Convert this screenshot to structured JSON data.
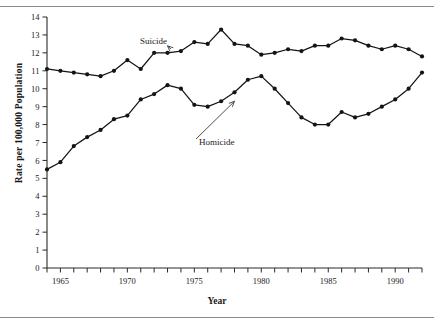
{
  "chart_data": {
    "type": "line",
    "title": "",
    "xlabel": "Year",
    "ylabel": "Rate per 100,000 Population",
    "xlim": [
      1964,
      1992
    ],
    "ylim": [
      0,
      14
    ],
    "grid": false,
    "legend": "annotations",
    "ytick_labels": [
      "0",
      "1",
      "2",
      "3",
      "4",
      "5",
      "6",
      "7",
      "8",
      "9",
      "10",
      "11",
      "12",
      "13",
      "14"
    ],
    "ytick_values": [
      0,
      1,
      2,
      3,
      4,
      5,
      6,
      7,
      8,
      9,
      10,
      11,
      12,
      13,
      14
    ],
    "xtick_labels": [
      "1965",
      "1970",
      "1975",
      "1980",
      "1985",
      "1990"
    ],
    "xtick_values": [
      1965,
      1970,
      1975,
      1980,
      1985,
      1990
    ],
    "xtick_all": [
      1964,
      1965,
      1966,
      1967,
      1968,
      1969,
      1970,
      1971,
      1972,
      1973,
      1974,
      1975,
      1976,
      1977,
      1978,
      1979,
      1980,
      1981,
      1982,
      1983,
      1984,
      1985,
      1986,
      1987,
      1988,
      1989,
      1990,
      1991,
      1992
    ],
    "x": [
      1964,
      1965,
      1966,
      1967,
      1968,
      1969,
      1970,
      1971,
      1972,
      1973,
      1974,
      1975,
      1976,
      1977,
      1978,
      1979,
      1980,
      1981,
      1982,
      1983,
      1984,
      1985,
      1986,
      1987,
      1988,
      1989,
      1990,
      1991,
      1992
    ],
    "series": [
      {
        "name": "Suicide",
        "values": [
          11.1,
          11.0,
          10.9,
          10.8,
          10.7,
          11.0,
          11.6,
          11.1,
          12.0,
          12.0,
          12.1,
          12.6,
          12.5,
          13.3,
          12.5,
          12.4,
          11.9,
          12.0,
          12.2,
          12.1,
          12.4,
          12.4,
          12.8,
          12.7,
          12.4,
          12.2,
          12.4,
          12.2,
          11.8
        ]
      },
      {
        "name": "Homicide",
        "values": [
          5.5,
          5.9,
          6.8,
          7.3,
          7.7,
          8.3,
          8.5,
          9.4,
          9.7,
          10.2,
          10.0,
          9.1,
          9.0,
          9.3,
          9.8,
          10.5,
          10.7,
          10.0,
          9.2,
          8.4,
          8.0,
          8.0,
          8.7,
          8.4,
          8.6,
          9.0,
          9.4,
          10.0,
          10.9
        ]
      }
    ],
    "annotations": [
      {
        "label": "Suicide",
        "points_to_year": 1973,
        "points_to_value": 12.0
      },
      {
        "label": "Homicide",
        "points_to_year": 1978,
        "points_to_value": 9.8
      }
    ]
  }
}
